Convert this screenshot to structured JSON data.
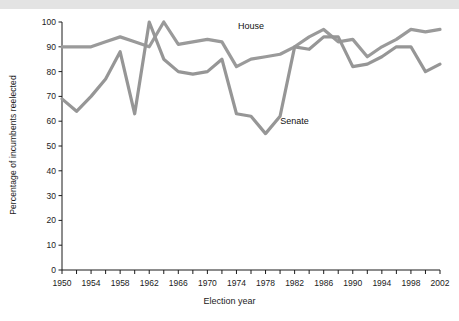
{
  "chart_data": {
    "type": "line",
    "title": "",
    "xlabel": "Election year",
    "ylabel": "Percentage of incumbents reelected",
    "xlim": [
      1950,
      2002
    ],
    "ylim": [
      0,
      100
    ],
    "ytick_step": 10,
    "xtick_step": 2,
    "xtick_label_step": 4,
    "grid": false,
    "legend_position": "inline-annotations",
    "x": [
      1950,
      1952,
      1954,
      1956,
      1958,
      1960,
      1962,
      1964,
      1966,
      1968,
      1970,
      1972,
      1974,
      1976,
      1978,
      1980,
      1982,
      1984,
      1986,
      1988,
      1990,
      1992,
      1994,
      1996,
      1998,
      2000,
      2002
    ],
    "series": [
      {
        "name": "House",
        "color": "#9a9a9a",
        "values": [
          90,
          90,
          90,
          92,
          94,
          92,
          90,
          100,
          91,
          92,
          93,
          92,
          82,
          85,
          86,
          87,
          90,
          94,
          97,
          92,
          93,
          86,
          90,
          93,
          97,
          96,
          97
        ]
      },
      {
        "name": "Senate",
        "color": "#969696",
        "values": [
          69,
          64,
          70,
          77,
          88,
          63,
          100,
          85,
          80,
          79,
          80,
          85,
          63,
          62,
          55,
          62,
          90,
          89,
          94,
          94,
          82,
          83,
          86,
          90,
          90,
          80,
          83
        ]
      }
    ],
    "ytick_labels": [
      "0",
      "10",
      "20",
      "30",
      "40",
      "50",
      "60",
      "70",
      "80",
      "90",
      "100"
    ],
    "xtick_labels": [
      "1950",
      "1954",
      "1958",
      "1962",
      "1966",
      "1970",
      "1974",
      "1978",
      "1982",
      "1986",
      "1990",
      "1994",
      "1998",
      "2002"
    ],
    "annotations": [
      {
        "text": "House",
        "x": 1976,
        "y": 97
      },
      {
        "text": "Senate",
        "x": 1982,
        "y": 59
      }
    ]
  },
  "colors": {
    "line": "#9b9b9b",
    "axis": "#1b1b1b",
    "band": "#e3e3e3",
    "text": "#1b1b1b"
  }
}
